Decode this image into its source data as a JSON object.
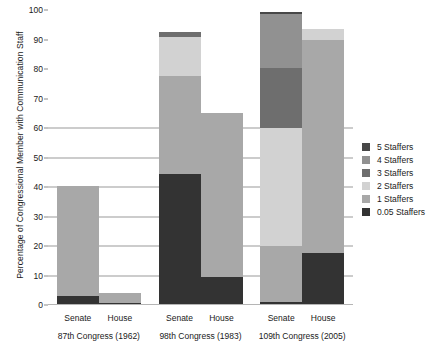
{
  "chart_data": {
    "type": "bar",
    "stacked": true,
    "title": "",
    "xlabel": "",
    "ylabel": "Percentage of Congressional Member with Communication Staff",
    "ylim": [
      0,
      100
    ],
    "ytick_labels": [
      "0",
      "10",
      "20",
      "30",
      "40",
      "50",
      "60",
      "70",
      "80",
      "90",
      "100"
    ],
    "ytick_values": [
      0,
      10,
      20,
      30,
      40,
      50,
      60,
      70,
      80,
      90,
      100
    ],
    "gridlines": [
      10,
      20,
      30,
      40,
      50,
      60
    ],
    "grid": true,
    "legend_position": "right",
    "series": [
      {
        "name": "5 Staffers",
        "color": "#474747"
      },
      {
        "name": "4 Staffers",
        "color": "#919191"
      },
      {
        "name": "3 Staffers",
        "color": "#6e6e6e"
      },
      {
        "name": "2 Staffers",
        "color": "#d2d2d2"
      },
      {
        "name": "1 Staffers",
        "color": "#a8a8a8"
      },
      {
        "name": "0.05 Staffers",
        "color": "#333333"
      }
    ],
    "groups": [
      {
        "label": "87th Congress (1962)",
        "bars": [
          {
            "label": "Senate",
            "total": 40.5,
            "segments": [
              {
                "series": "0.05 Staffers",
                "value": 3.0,
                "from": 0.0,
                "to": 3.0
              },
              {
                "series": "1 Staffers",
                "value": 37.5,
                "from": 3.0,
                "to": 40.5
              }
            ]
          },
          {
            "label": "House",
            "total": 4.0,
            "segments": [
              {
                "series": "0.05 Staffers",
                "value": 0.8,
                "from": 0.0,
                "to": 0.8
              },
              {
                "series": "1 Staffers",
                "value": 3.2,
                "from": 0.8,
                "to": 4.0
              }
            ]
          }
        ]
      },
      {
        "label": "98th Congress (1983)",
        "bars": [
          {
            "label": "Senate",
            "total": 92.5,
            "segments": [
              {
                "series": "0.05 Staffers",
                "value": 44.5,
                "from": 0.0,
                "to": 44.5
              },
              {
                "series": "1 Staffers",
                "value": 33.0,
                "from": 44.5,
                "to": 77.5
              },
              {
                "series": "2 Staffers",
                "value": 13.5,
                "from": 77.5,
                "to": 91.0
              },
              {
                "series": "3 Staffers",
                "value": 1.5,
                "from": 91.0,
                "to": 92.5
              }
            ]
          },
          {
            "label": "House",
            "total": 65.0,
            "segments": [
              {
                "series": "0.05 Staffers",
                "value": 9.5,
                "from": 0.0,
                "to": 9.5
              },
              {
                "series": "1 Staffers",
                "value": 55.5,
                "from": 9.5,
                "to": 65.0
              }
            ]
          }
        ]
      },
      {
        "label": "109th Congress (2005)",
        "bars": [
          {
            "label": "Senate",
            "total": 99.5,
            "segments": [
              {
                "series": "0.05 Staffers",
                "value": 1.0,
                "from": 0.0,
                "to": 1.0
              },
              {
                "series": "1 Staffers",
                "value": 19.0,
                "from": 1.0,
                "to": 20.0
              },
              {
                "series": "2 Staffers",
                "value": 40.0,
                "from": 20.0,
                "to": 60.0
              },
              {
                "series": "3 Staffers",
                "value": 20.5,
                "from": 60.0,
                "to": 80.5
              },
              {
                "series": "4 Staffers",
                "value": 18.0,
                "from": 80.5,
                "to": 98.5
              },
              {
                "series": "5 Staffers",
                "value": 1.0,
                "from": 98.5,
                "to": 99.5
              }
            ]
          },
          {
            "label": "House",
            "total": 93.5,
            "segments": [
              {
                "series": "0.05 Staffers",
                "value": 17.5,
                "from": 0.0,
                "to": 17.5
              },
              {
                "series": "1 Staffers",
                "value": 72.5,
                "from": 17.5,
                "to": 90.0
              },
              {
                "series": "2 Staffers",
                "value": 3.5,
                "from": 90.0,
                "to": 93.5
              }
            ]
          }
        ]
      }
    ]
  }
}
